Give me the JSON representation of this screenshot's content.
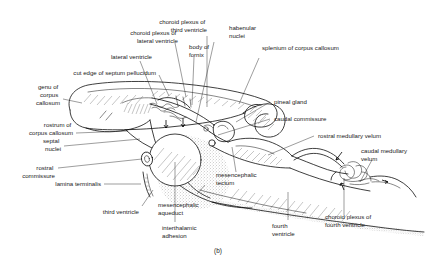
{
  "figure": {
    "caption": "(b)",
    "background_color": "#ffffff",
    "line_color": "#000000",
    "text_color": "#1a1a1a"
  },
  "labels": {
    "choroid_plexus_third_ventricle": {
      "line1": "choroid plexus of",
      "line2": "third ventricle"
    },
    "habenular_nuclei": {
      "line1": "habenular",
      "line2": "nuclei"
    },
    "splenium_corpus_callosum": {
      "line1": "splenium of corpus callosum"
    },
    "choroid_plexus_lateral_ventricle": {
      "line1": "choroid plexus of",
      "line2": "lateral ventricle"
    },
    "body_of_fornix": {
      "line1": "body of",
      "line2": "fornix"
    },
    "lateral_ventricle": {
      "line1": "lateral ventricle"
    },
    "cut_edge_septum_pellucidum": {
      "line1": "cut edge of septum pellucidum"
    },
    "genu_corpus_callosum": {
      "line1": "genu of",
      "line2": "corpus",
      "line3": "callosum"
    },
    "pineal_gland": {
      "line1": "pineal gland"
    },
    "caudal_commissure": {
      "line1": "caudal commissure"
    },
    "rostrum_corpus_callosum": {
      "line1": "rostrum of",
      "line2": "corpus callosum"
    },
    "septal_nuclei": {
      "line1": "septal",
      "line2": "nuclei"
    },
    "rostral_commissure": {
      "line1": "rostral",
      "line2": "commissure"
    },
    "lamina_terminalis": {
      "line1": "lamina terminalis"
    },
    "rostral_medullary_velum": {
      "line1": "rostral medullary velum"
    },
    "caudal_medullary_velum": {
      "line1": "caudal medullary",
      "line2": "velum"
    },
    "mesencephalic_tectum": {
      "line1": "mesencephalic",
      "line2": "tectum"
    },
    "mesencephalic_aqueduct": {
      "line1": "mesencephalic",
      "line2": "aqueduct"
    },
    "third_ventricle": {
      "line1": "third ventricle"
    },
    "interthalamic_adhesion": {
      "line1": "interthalamic",
      "line2": "adhesion"
    },
    "fourth_ventricle": {
      "line1": "fourth",
      "line2": "ventricle"
    },
    "choroid_plexus_fourth_ventricle": {
      "line1": "choroid plexus of",
      "line2": "fourth ventricle"
    }
  }
}
